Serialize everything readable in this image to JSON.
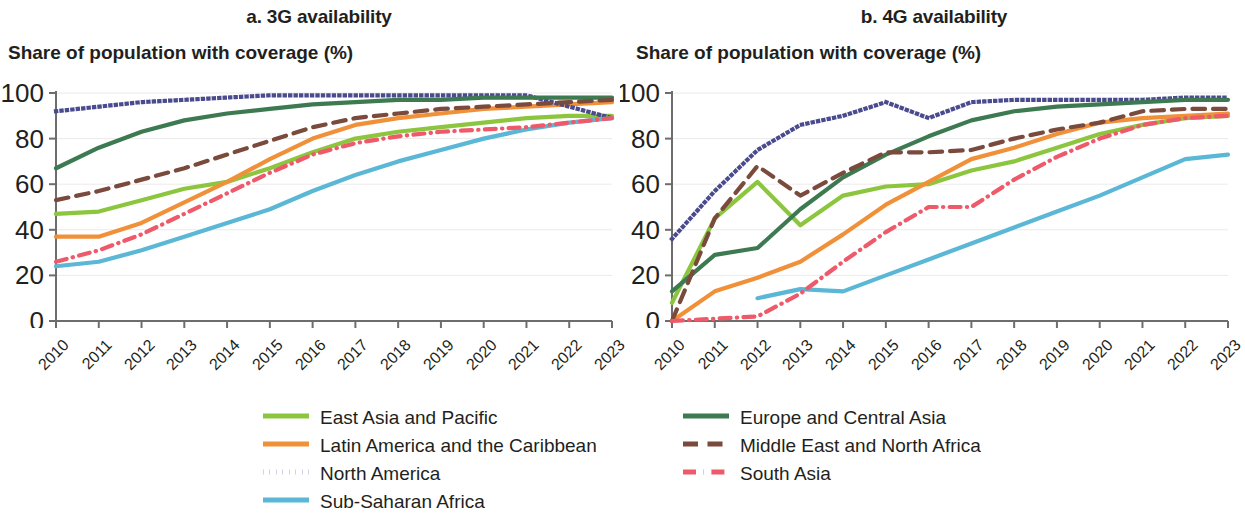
{
  "figure": {
    "panels": [
      {
        "key": "a",
        "title": "a. 3G availability",
        "axis_title": "Share of population with coverage (%)"
      },
      {
        "key": "b",
        "title": "b. 4G availability",
        "axis_title": "Share of population with coverage (%)"
      }
    ]
  },
  "legend": {
    "left": [
      {
        "label": "East Asia and Pacific",
        "color": "#8cc63e",
        "style": "solid"
      },
      {
        "label": "Latin America and the Caribbean",
        "color": "#f0913a",
        "style": "solid"
      },
      {
        "label": "North America",
        "color": "#4a4a8f",
        "style": "dotted"
      },
      {
        "label": "Sub-Saharan Africa",
        "color": "#5bb7d6",
        "style": "solid"
      }
    ],
    "right": [
      {
        "label": "Europe and Central Asia",
        "color": "#3d7a52",
        "style": "solid"
      },
      {
        "label": "Middle East and North Africa",
        "color": "#7a4a3c",
        "style": "dashed"
      },
      {
        "label": "South Asia",
        "color": "#ee5a6a",
        "style": "dashdot"
      }
    ]
  },
  "chart_data": [
    {
      "type": "line",
      "panel": "a",
      "title": "a. 3G availability",
      "xlabel": "",
      "ylabel": "Share of population with coverage (%)",
      "x": [
        2010,
        2011,
        2012,
        2013,
        2014,
        2015,
        2016,
        2017,
        2018,
        2019,
        2020,
        2021,
        2022,
        2023
      ],
      "xtick_labels": [
        "2010",
        "2011",
        "2012",
        "2013",
        "2014",
        "2015",
        "2016",
        "2017",
        "2018",
        "2019",
        "2020",
        "2021",
        "2022",
        "2023"
      ],
      "ylim": [
        0,
        100
      ],
      "yticks": [
        0,
        20,
        40,
        60,
        80,
        100
      ],
      "grid": true,
      "legend_position": "bottom",
      "series": [
        {
          "name": "East Asia and Pacific",
          "color": "#8cc63e",
          "style": "solid",
          "values": [
            47,
            48,
            53,
            58,
            61,
            67,
            74,
            80,
            83,
            85,
            87,
            89,
            90,
            90
          ]
        },
        {
          "name": "Latin America and the Caribbean",
          "color": "#f0913a",
          "style": "solid",
          "values": [
            37,
            37,
            43,
            52,
            61,
            71,
            80,
            86,
            89,
            91,
            93,
            94,
            95,
            96
          ]
        },
        {
          "name": "North America",
          "color": "#4a4a8f",
          "style": "dotted",
          "values": [
            92,
            94,
            96,
            97,
            98,
            99,
            99,
            99,
            99,
            99,
            99,
            99,
            94,
            89
          ]
        },
        {
          "name": "Sub-Saharan Africa",
          "color": "#5bb7d6",
          "style": "solid",
          "values": [
            24,
            26,
            31,
            37,
            43,
            49,
            57,
            64,
            70,
            75,
            80,
            84,
            87,
            89
          ]
        },
        {
          "name": "Europe and Central Asia",
          "color": "#3d7a52",
          "style": "solid",
          "values": [
            67,
            76,
            83,
            88,
            91,
            93,
            95,
            96,
            97,
            97,
            98,
            98,
            98,
            98
          ]
        },
        {
          "name": "Middle East and North Africa",
          "color": "#7a4a3c",
          "style": "dashed",
          "values": [
            53,
            57,
            62,
            67,
            73,
            79,
            85,
            89,
            91,
            93,
            94,
            95,
            96,
            97
          ]
        },
        {
          "name": "South Asia",
          "color": "#ee5a6a",
          "style": "dashdot",
          "values": [
            26,
            31,
            38,
            47,
            56,
            65,
            73,
            78,
            81,
            83,
            84,
            85,
            87,
            89
          ]
        }
      ]
    },
    {
      "type": "line",
      "panel": "b",
      "title": "b. 4G availability",
      "xlabel": "",
      "ylabel": "Share of population with coverage (%)",
      "x": [
        2010,
        2011,
        2012,
        2013,
        2014,
        2015,
        2016,
        2017,
        2018,
        2019,
        2020,
        2021,
        2022,
        2023
      ],
      "xtick_labels": [
        "2010",
        "2011",
        "2012",
        "2013",
        "2014",
        "2015",
        "2016",
        "2017",
        "2018",
        "2019",
        "2020",
        "2021",
        "2022",
        "2023"
      ],
      "ylim": [
        0,
        100
      ],
      "yticks": [
        0,
        20,
        40,
        60,
        80,
        100
      ],
      "grid": true,
      "legend_position": "bottom",
      "series": [
        {
          "name": "East Asia and Pacific",
          "color": "#8cc63e",
          "style": "solid",
          "values": [
            8,
            45,
            61,
            42,
            55,
            59,
            60,
            66,
            70,
            76,
            82,
            86,
            89,
            90
          ]
        },
        {
          "name": "Latin America and the Caribbean",
          "color": "#f0913a",
          "style": "solid",
          "values": [
            0,
            13,
            19,
            26,
            38,
            51,
            61,
            71,
            76,
            82,
            87,
            89,
            90,
            91
          ]
        },
        {
          "name": "North America",
          "color": "#4a4a8f",
          "style": "dotted",
          "values": [
            36,
            57,
            75,
            86,
            90,
            96,
            89,
            96,
            97,
            97,
            97,
            97,
            98,
            98
          ]
        },
        {
          "name": "Sub-Saharan Africa",
          "color": "#5bb7d6",
          "style": "solid",
          "values": [
            null,
            null,
            10,
            14,
            13,
            20,
            27,
            34,
            41,
            48,
            55,
            63,
            71,
            73
          ]
        },
        {
          "name": "Europe and Central Asia",
          "color": "#3d7a52",
          "style": "solid",
          "values": [
            13,
            29,
            32,
            49,
            63,
            73,
            81,
            88,
            92,
            94,
            95,
            96,
            97,
            97
          ]
        },
        {
          "name": "Middle East and North Africa",
          "color": "#7a4a3c",
          "style": "dashed",
          "values": [
            0,
            45,
            68,
            55,
            65,
            74,
            74,
            75,
            80,
            84,
            87,
            92,
            93,
            93
          ]
        },
        {
          "name": "South Asia",
          "color": "#ee5a6a",
          "style": "dashdot",
          "values": [
            0,
            1,
            2,
            12,
            26,
            39,
            50,
            50,
            62,
            72,
            80,
            86,
            89,
            90
          ]
        }
      ]
    }
  ]
}
